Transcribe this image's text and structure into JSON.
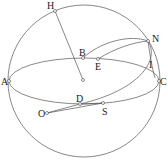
{
  "diagram": {
    "type": "celestial-sphere-geometry",
    "colors": {
      "stroke": "#555555",
      "text": "#222222",
      "background": "#ffffff"
    },
    "points": [
      {
        "id": "H",
        "label": "H"
      },
      {
        "id": "B",
        "label": "B"
      },
      {
        "id": "E",
        "label": "E"
      },
      {
        "id": "N",
        "label": "N"
      },
      {
        "id": "I",
        "label": "I"
      },
      {
        "id": "A",
        "label": "A"
      },
      {
        "id": "C",
        "label": "C"
      },
      {
        "id": "D",
        "label": "D"
      },
      {
        "id": "S",
        "label": "S"
      },
      {
        "id": "O",
        "label": "O"
      }
    ],
    "labels": {
      "H": "H",
      "B": "B",
      "E": "E",
      "N": "N",
      "I": "I",
      "A": "A",
      "C": "C",
      "D": "D",
      "S": "S",
      "O": "O"
    },
    "elements": [
      "outer sphere circle",
      "equatorial ellipse through A, B, C, D",
      "great-circle arc B–N",
      "arc E–N",
      "tilted great circle through N, D",
      "radius H–center",
      "segment O–D",
      "segment O–S"
    ]
  }
}
